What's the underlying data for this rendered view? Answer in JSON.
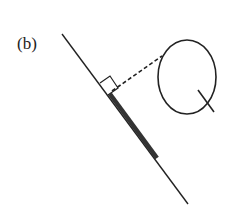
{
  "figure": {
    "panel_label": "(b)",
    "elements": {
      "line": "long diagonal line",
      "thick_segment": "thickened portion of the line (projection)",
      "dashed_connector": "dashed perpendicular from curve to line",
      "right_angle_marker": "right-angle square at foot of perpendicular",
      "curve": "closed loop (Q-shaped) with a short tail"
    },
    "colors": {
      "stroke": "#222222",
      "thick": "#333333",
      "background": "#ffffff"
    }
  }
}
